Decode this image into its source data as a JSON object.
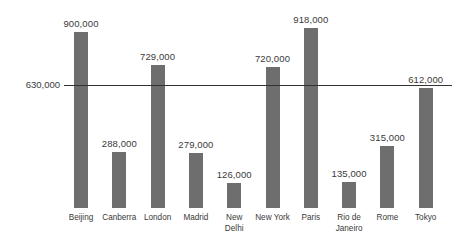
{
  "chart_data": {
    "type": "bar",
    "title": "",
    "xlabel": "",
    "ylabel": "",
    "categories": [
      "Beijing",
      "Canberra",
      "London",
      "Madrid",
      "New\nDelhi",
      "New York",
      "Paris",
      "Rio de\nJaneiro",
      "Rome",
      "Tokyo"
    ],
    "values": [
      900000,
      288000,
      729000,
      279000,
      126000,
      720000,
      918000,
      135000,
      315000,
      612000
    ],
    "value_labels": [
      "900,000",
      "288,000",
      "729,000",
      "279,000",
      "126,000",
      "720,000",
      "918,000",
      "135,000",
      "315,000",
      "612,000"
    ],
    "ylim": [
      0,
      1063000
    ],
    "grid": false,
    "legend": null,
    "bar_color": "#6e6e6e",
    "text_color": "#3a3a3a",
    "background_color": "#ffffff",
    "reference_line": {
      "value": 630000,
      "label": "630,000",
      "color": "#333333"
    }
  }
}
